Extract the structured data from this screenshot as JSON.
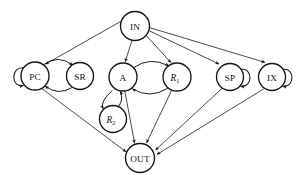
{
  "figure": {
    "type": "directed-graph",
    "background_color": "#ffffff",
    "stroke_color": "#1d1d1d",
    "node_fill": "#ffffff",
    "width": 298,
    "height": 182
  },
  "nodes": [
    {
      "id": "IN",
      "label": "IN",
      "sub": "",
      "italic": false,
      "cx": 135,
      "cy": 26,
      "r": 14.5
    },
    {
      "id": "PC",
      "label": "PC",
      "sub": "",
      "italic": false,
      "cx": 35,
      "cy": 76,
      "r": 14.0
    },
    {
      "id": "SR",
      "label": "SR",
      "sub": "",
      "italic": false,
      "cx": 80,
      "cy": 76,
      "r": 13.5
    },
    {
      "id": "A",
      "label": "A",
      "sub": "",
      "italic": false,
      "cx": 123,
      "cy": 77,
      "r": 14.0
    },
    {
      "id": "R1",
      "label": "R",
      "sub": "1",
      "italic": true,
      "cx": 177,
      "cy": 77,
      "r": 14.0
    },
    {
      "id": "R2",
      "label": "R",
      "sub": "2",
      "italic": true,
      "cx": 113,
      "cy": 119,
      "r": 13.5
    },
    {
      "id": "SP",
      "label": "SP",
      "sub": "",
      "italic": false,
      "cx": 230,
      "cy": 77,
      "r": 13.5
    },
    {
      "id": "IX",
      "label": "IX",
      "sub": "",
      "italic": false,
      "cx": 272,
      "cy": 77,
      "r": 13.5
    },
    {
      "id": "OUT",
      "label": "OUT",
      "sub": "",
      "italic": false,
      "cx": 140,
      "cy": 158,
      "r": 14.5
    }
  ],
  "edges": [
    {
      "from": "IN",
      "to": "PC",
      "kind": "straight"
    },
    {
      "from": "IN",
      "to": "A",
      "kind": "straight"
    },
    {
      "from": "IN",
      "to": "R1",
      "kind": "straight"
    },
    {
      "from": "IN",
      "to": "SP",
      "kind": "straight"
    },
    {
      "from": "IN",
      "to": "IX",
      "kind": "straight"
    },
    {
      "from": "PC",
      "to": "SR",
      "kind": "arc-top"
    },
    {
      "from": "SR",
      "to": "PC",
      "kind": "arc-bottom"
    },
    {
      "from": "A",
      "to": "R1",
      "kind": "arc-top"
    },
    {
      "from": "R1",
      "to": "A",
      "kind": "arc-bottom"
    },
    {
      "from": "A",
      "to": "R2",
      "kind": "arc-left"
    },
    {
      "from": "R2",
      "to": "A",
      "kind": "arc-right"
    },
    {
      "from": "PC",
      "to": "OUT",
      "kind": "straight"
    },
    {
      "from": "A",
      "to": "OUT",
      "kind": "straight"
    },
    {
      "from": "R1",
      "to": "OUT",
      "kind": "straight"
    },
    {
      "from": "SP",
      "to": "OUT",
      "kind": "straight"
    },
    {
      "from": "IX",
      "to": "OUT",
      "kind": "straight"
    }
  ],
  "self_loops": [
    {
      "node": "PC",
      "side": "left"
    },
    {
      "node": "SP",
      "side": "right"
    },
    {
      "node": "IX",
      "side": "right"
    }
  ]
}
